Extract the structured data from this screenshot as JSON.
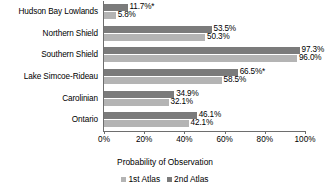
{
  "chart_data": {
    "type": "bar",
    "orientation": "horizontal",
    "title": "",
    "xlabel": "Probability of Observation",
    "ylabel": "",
    "xlim": [
      0,
      100
    ],
    "xticks": [
      "0%",
      "20%",
      "40%",
      "60%",
      "80%",
      "100%"
    ],
    "xtick_values": [
      0,
      20,
      40,
      60,
      80,
      100
    ],
    "grid": false,
    "legend_position": "bottom",
    "categories": [
      "Hudson Bay Lowlands",
      "Northern Shield",
      "Southern Shield",
      "Lake Simcoe-Rideau",
      "Carolinian",
      "Ontario"
    ],
    "series": [
      {
        "name": "1st Atlas",
        "color": "#7b7b7b",
        "values": [
          11.7,
          53.5,
          97.3,
          66.5,
          34.9,
          46.1
        ],
        "labels": [
          "11.7%*",
          "53.5%",
          "97.3%",
          "66.5%*",
          "34.9%",
          "46.1%"
        ]
      },
      {
        "name": "2nd Atlas",
        "color": "#b4b4b4",
        "values": [
          5.8,
          50.3,
          96.0,
          58.5,
          32.1,
          42.1
        ],
        "labels": [
          "5.8%",
          "50.3%",
          "96.0%",
          "58.5%",
          "32.1%",
          "42.1%"
        ]
      }
    ],
    "annotations": {
      "asterisk_note": "*"
    }
  }
}
